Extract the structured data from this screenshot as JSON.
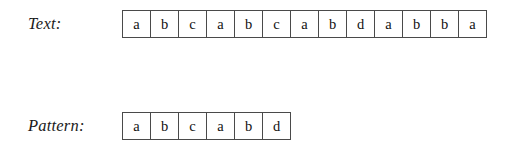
{
  "figure": {
    "kind": "string-matching-illustration",
    "background_color": "#ffffff",
    "line_color": "#4a4a4a",
    "text_color": "#111111"
  },
  "rows": [
    {
      "label": "Text:",
      "name": "text",
      "cells": [
        "a",
        "b",
        "c",
        "a",
        "b",
        "c",
        "a",
        "b",
        "d",
        "a",
        "b",
        "b",
        "a"
      ],
      "length": 13
    },
    {
      "label": "Pattern:",
      "name": "pattern",
      "cells": [
        "a",
        "b",
        "c",
        "a",
        "b",
        "d"
      ],
      "length": 6
    }
  ]
}
